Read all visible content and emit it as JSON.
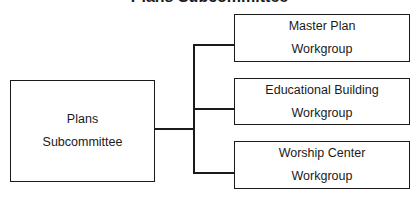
{
  "title": "Plans Subcommittee",
  "root": {
    "line1": "Plans",
    "line2": "Subcommittee"
  },
  "children": [
    {
      "line1": "Master Plan",
      "line2": "Workgroup"
    },
    {
      "line1": "Educational Building",
      "line2": "Workgroup"
    },
    {
      "line1": "Worship Center",
      "line2": "Workgroup"
    }
  ]
}
